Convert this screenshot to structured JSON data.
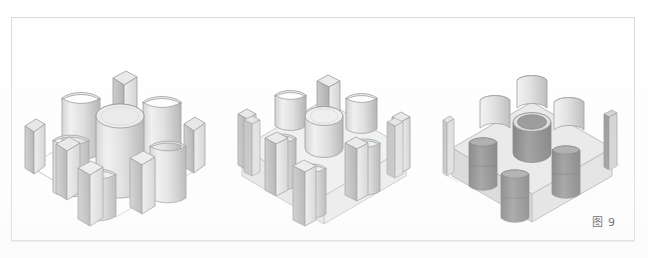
{
  "figure": {
    "caption": "图 9",
    "caption_label": "图",
    "caption_number": "9",
    "frame_border_color": "#d7d9db",
    "background_color": "#ffffff"
  },
  "palette": {
    "outline": "#8c8f92",
    "wireframe": "#c3c6c9",
    "face_light": "#efefef",
    "face_mid": "#d8d8d8",
    "face_shadow": "#b9b9b9",
    "face_dark": "#9d9d9d",
    "cut_interior": "#8a8a8a",
    "cut_interior_dark": "#787878",
    "block_top": "#e4e4e4",
    "block_side_left": "#d2d2d2",
    "block_side_right": "#dcdcdc",
    "ghost_fill": "#eceded"
  },
  "panels": [
    {
      "id": "panel-tools",
      "index": 1,
      "name": "tool-solids-array",
      "description": "九个工具实体按 3×3 阵列排列在基准平面上",
      "base_plane": "wireframe-square",
      "solid_count": 9,
      "solids": [
        {
          "name": "center-cylinder",
          "shape": "cylinder",
          "row": 2,
          "col": 2,
          "height": "tall"
        },
        {
          "name": "edge-half-cyl-back",
          "shape": "half-cylinder",
          "row": 1,
          "col": 2,
          "height": "tall"
        },
        {
          "name": "edge-half-cyl-left",
          "shape": "half-cylinder",
          "row": 2,
          "col": 1,
          "height": "tall"
        },
        {
          "name": "edge-half-cyl-right",
          "shape": "half-cylinder",
          "row": 2,
          "col": 3,
          "height": "tall"
        },
        {
          "name": "edge-half-cyl-front",
          "shape": "half-cylinder",
          "row": 3,
          "col": 2,
          "height": "tall"
        },
        {
          "name": "corner-box-back-left",
          "shape": "box",
          "row": 1,
          "col": 1,
          "height": "tall"
        },
        {
          "name": "corner-box-back-right",
          "shape": "box",
          "row": 1,
          "col": 3,
          "height": "tall"
        },
        {
          "name": "corner-box-front-left",
          "shape": "box",
          "row": 3,
          "col": 1,
          "height": "tall"
        },
        {
          "name": "corner-box-front-right",
          "shape": "box",
          "row": 3,
          "col": 3,
          "height": "tall"
        }
      ]
    },
    {
      "id": "panel-intersect",
      "index": 2,
      "name": "tools-with-transparent-cube",
      "description": "工具实体与透明立方体相交（求差运算前）",
      "base_plane": "transparent-cube",
      "solid_count": 9,
      "cube": {
        "name": "target-cube",
        "shape": "cube",
        "style": "transparent"
      }
    },
    {
      "id": "panel-result",
      "index": 3,
      "name": "boolean-difference-result",
      "description": "布尔求差后的结果：立方体上形成圆孔、半圆槽与方槽",
      "base_plane": "solid-block",
      "feature_count": 9,
      "features": [
        {
          "name": "center-through-hole",
          "shape": "round-hole",
          "row": 2,
          "col": 2
        },
        {
          "name": "edge-slot-back",
          "shape": "half-round-slot",
          "row": 1,
          "col": 2
        },
        {
          "name": "edge-slot-left",
          "shape": "half-round-slot",
          "row": 2,
          "col": 1
        },
        {
          "name": "edge-slot-right",
          "shape": "half-round-slot",
          "row": 2,
          "col": 3
        },
        {
          "name": "edge-slot-front",
          "shape": "half-round-slot",
          "row": 3,
          "col": 2
        },
        {
          "name": "corner-notch-back-left",
          "shape": "square-notch",
          "row": 1,
          "col": 1
        },
        {
          "name": "corner-notch-back-right",
          "shape": "square-notch",
          "row": 1,
          "col": 3
        },
        {
          "name": "corner-notch-front-left",
          "shape": "square-notch",
          "row": 3,
          "col": 1
        },
        {
          "name": "corner-notch-front-right",
          "shape": "square-notch",
          "row": 3,
          "col": 3
        }
      ]
    }
  ]
}
